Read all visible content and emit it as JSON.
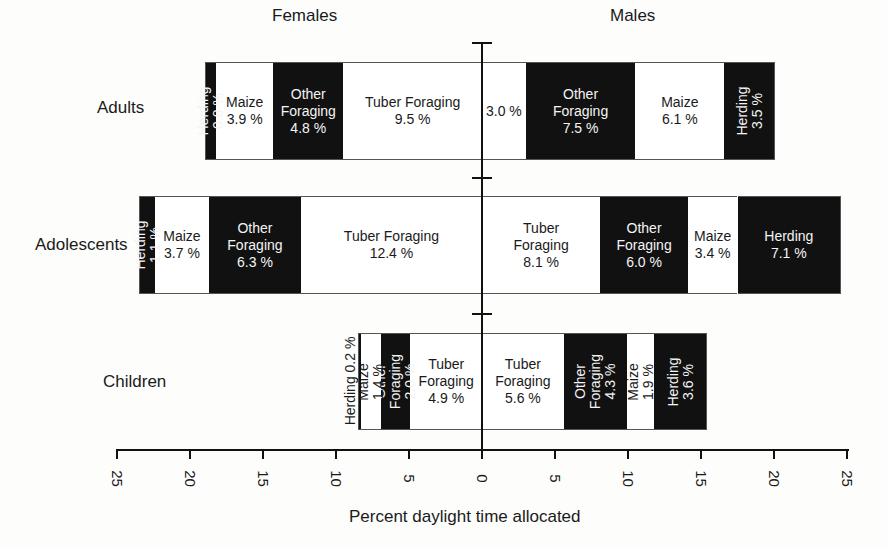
{
  "chart_data": {
    "type": "bar",
    "orientation": "horizontal-diverging-stacked",
    "title": "",
    "xlabel": "Percent daylight time allocated",
    "ylabel": "",
    "xlim": [
      -25,
      25
    ],
    "x_ticks": [
      25,
      20,
      15,
      10,
      5,
      0,
      5,
      10,
      15,
      20,
      25
    ],
    "grid": false,
    "sides": [
      {
        "name": "Females",
        "direction": "left"
      },
      {
        "name": "Males",
        "direction": "right"
      }
    ],
    "categories": [
      "Adults",
      "Adolescents",
      "Children"
    ],
    "fill_colors": {
      "Tuber Foraging": "#ffffff",
      "Other Foraging": "#111111",
      "Maize": "#ffffff",
      "Herding": "#111111"
    },
    "series": [
      {
        "group": "Adults",
        "females": [
          {
            "activity": "Tuber Foraging",
            "value": 9.5,
            "label": "Tuber Foraging\n9.5 %"
          },
          {
            "activity": "Other Foraging",
            "value": 4.8,
            "label": "Other\nForaging\n4.8 %"
          },
          {
            "activity": "Maize",
            "value": 3.9,
            "label": "Maize\n3.9 %"
          },
          {
            "activity": "Herding",
            "value": 0.8,
            "label": "Herding 0.8 %",
            "vertical": true
          }
        ],
        "males": [
          {
            "activity": "Tuber Foraging",
            "value": 3.0,
            "label": "3.0 %"
          },
          {
            "activity": "Other Foraging",
            "value": 7.5,
            "label": "Other\nForaging\n7.5 %"
          },
          {
            "activity": "Maize",
            "value": 6.1,
            "label": "Maize\n6.1 %"
          },
          {
            "activity": "Herding",
            "value": 3.5,
            "label": "Herding\n3.5 %",
            "vertical": true
          }
        ]
      },
      {
        "group": "Adolescents",
        "females": [
          {
            "activity": "Tuber Foraging",
            "value": 12.4,
            "label": "Tuber Foraging\n12.4 %"
          },
          {
            "activity": "Other Foraging",
            "value": 6.3,
            "label": "Other\nForaging\n6.3 %"
          },
          {
            "activity": "Maize",
            "value": 3.7,
            "label": "Maize\n3.7 %"
          },
          {
            "activity": "Herding",
            "value": 1.1,
            "label": "Herding 1.1 %",
            "vertical": true
          }
        ],
        "males": [
          {
            "activity": "Tuber Foraging",
            "value": 8.1,
            "label": "Tuber\nForaging\n8.1 %"
          },
          {
            "activity": "Other Foraging",
            "value": 6.0,
            "label": "Other\nForaging\n6.0 %"
          },
          {
            "activity": "Maize",
            "value": 3.4,
            "label": "Maize\n3.4 %"
          },
          {
            "activity": "Herding",
            "value": 7.1,
            "label": "Herding\n7.1 %"
          }
        ]
      },
      {
        "group": "Children",
        "females": [
          {
            "activity": "Tuber Foraging",
            "value": 4.9,
            "label": "Tuber\nForaging\n4.9 %"
          },
          {
            "activity": "Other Foraging",
            "value": 2.0,
            "label": "Other Foraging\n2.0 %",
            "vertical": true
          },
          {
            "activity": "Maize",
            "value": 1.4,
            "label": "Maize 1.4 %",
            "vertical": true
          },
          {
            "activity": "Herding",
            "value": 0.2,
            "label": "Herding 0.2 %",
            "vertical": true,
            "outside": true
          }
        ],
        "males": [
          {
            "activity": "Tuber Foraging",
            "value": 5.6,
            "label": "Tuber\nForaging\n5.6 %"
          },
          {
            "activity": "Other Foraging",
            "value": 4.3,
            "label": "Other Foraging\n4.3 %",
            "vertical": true
          },
          {
            "activity": "Maize",
            "value": 1.9,
            "label": "Maize 1.9 %",
            "vertical": true
          },
          {
            "activity": "Herding",
            "value": 3.6,
            "label": "Herding\n3.6 %",
            "vertical": true
          }
        ]
      }
    ]
  },
  "labels": {
    "females": "Females",
    "males": "Males",
    "adults": "Adults",
    "adolescents": "Adolescents",
    "children": "Children",
    "xlabel": "Percent daylight time allocated"
  }
}
